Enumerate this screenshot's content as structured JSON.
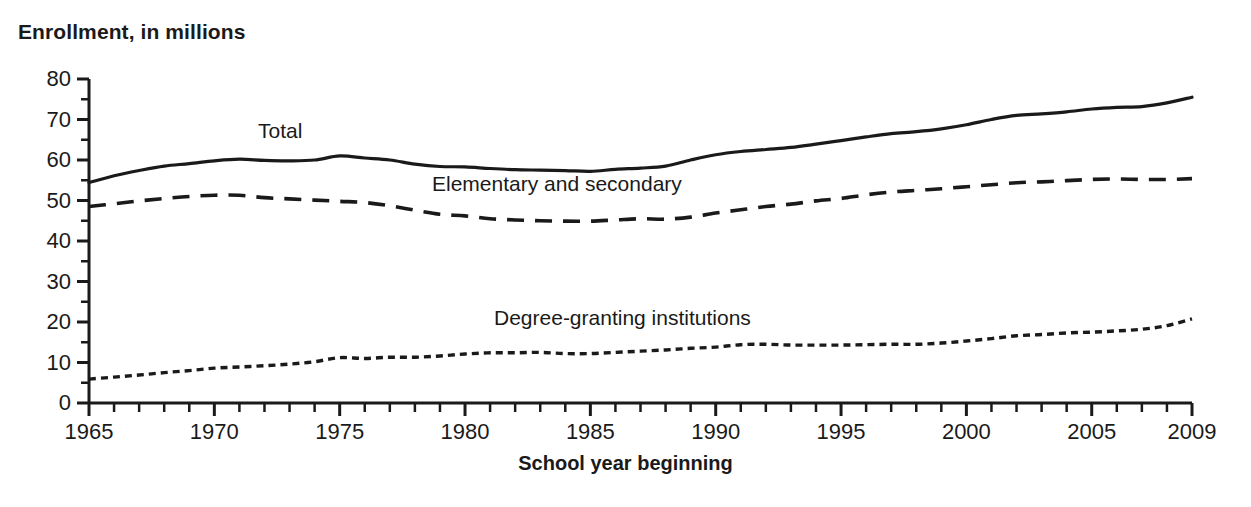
{
  "chart_data": {
    "type": "line",
    "title": "",
    "ylabel": "Enrollment, in millions",
    "xlabel": "School year beginning",
    "xlim": [
      1965,
      2009
    ],
    "ylim": [
      0,
      80
    ],
    "grid": false,
    "legend_position": "inline-annotations",
    "x_tick_labels": [
      "1965",
      "1970",
      "1975",
      "1980",
      "1985",
      "1990",
      "1995",
      "2000",
      "2005",
      "2009"
    ],
    "x_tick_values": [
      1965,
      1970,
      1975,
      1980,
      1985,
      1990,
      1995,
      2000,
      2005,
      2009
    ],
    "x_minor_tick_step": 1,
    "y_tick_labels": [
      "0",
      "10",
      "20",
      "30",
      "40",
      "50",
      "60",
      "70",
      "80"
    ],
    "y_tick_values": [
      0,
      10,
      20,
      30,
      40,
      50,
      60,
      70,
      80
    ],
    "y_minor_tick_step": 5,
    "x": [
      1965,
      1966,
      1967,
      1968,
      1969,
      1970,
      1971,
      1972,
      1973,
      1974,
      1975,
      1976,
      1977,
      1978,
      1979,
      1980,
      1981,
      1982,
      1983,
      1984,
      1985,
      1986,
      1987,
      1988,
      1989,
      1990,
      1991,
      1992,
      1993,
      1994,
      1995,
      1996,
      1997,
      1998,
      1999,
      2000,
      2001,
      2002,
      2003,
      2004,
      2005,
      2006,
      2007,
      2008,
      2009
    ],
    "series": [
      {
        "name": "Total",
        "style": "solid",
        "color": "#1a1a1a",
        "label_text": "Total",
        "values": [
          54.4,
          56.1,
          57.4,
          58.5,
          59.1,
          59.8,
          60.2,
          59.9,
          59.8,
          60.0,
          61.0,
          60.5,
          60.0,
          59.0,
          58.4,
          58.3,
          57.9,
          57.6,
          57.5,
          57.4,
          57.2,
          57.7,
          58.0,
          58.5,
          60.0,
          61.3,
          62.1,
          62.6,
          63.1,
          63.9,
          64.8,
          65.7,
          66.5,
          67.0,
          67.7,
          68.7,
          70.0,
          71.0,
          71.4,
          71.9,
          72.6,
          73.0,
          73.2,
          74.1,
          75.5
        ]
      },
      {
        "name": "Elementary and secondary",
        "style": "dashed",
        "color": "#1a1a1a",
        "label_text": "Elementary and secondary",
        "values": [
          48.5,
          49.2,
          49.9,
          50.5,
          51.0,
          51.3,
          51.3,
          50.7,
          50.4,
          50.1,
          49.8,
          49.5,
          48.7,
          47.6,
          46.6,
          46.2,
          45.5,
          45.2,
          45.0,
          44.9,
          44.9,
          45.2,
          45.5,
          45.4,
          45.9,
          46.9,
          47.7,
          48.5,
          49.1,
          49.9,
          50.5,
          51.4,
          52.1,
          52.5,
          52.9,
          53.4,
          53.9,
          54.4,
          54.6,
          54.9,
          55.2,
          55.3,
          55.2,
          55.2,
          55.4
        ]
      },
      {
        "name": "Degree-granting institutions",
        "style": "dotted",
        "color": "#1a1a1a",
        "label_text": "Degree-granting institutions",
        "values": [
          5.9,
          6.4,
          6.9,
          7.5,
          8.0,
          8.6,
          8.9,
          9.2,
          9.6,
          10.2,
          11.2,
          11.0,
          11.3,
          11.3,
          11.6,
          12.1,
          12.4,
          12.4,
          12.5,
          12.2,
          12.2,
          12.5,
          12.8,
          13.1,
          13.5,
          13.8,
          14.4,
          14.5,
          14.3,
          14.3,
          14.3,
          14.4,
          14.5,
          14.5,
          14.8,
          15.3,
          15.9,
          16.6,
          16.9,
          17.3,
          17.5,
          17.8,
          18.2,
          19.1,
          20.8
        ]
      }
    ]
  },
  "axis": {
    "y_title": "Enrollment, in millions",
    "x_title": "School year beginning"
  }
}
